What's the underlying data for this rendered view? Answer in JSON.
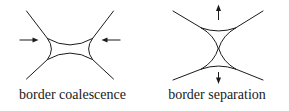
{
  "figure": {
    "background_color": "#ffffff",
    "ink_color": "#1b1b1b",
    "panels": [
      {
        "id": "coalescence",
        "caption": "border coalescence",
        "diagram_name": "concave-square-border-diagram",
        "arrows": [
          {
            "name": "arrow-left-inward",
            "direction": "right",
            "label": ""
          },
          {
            "name": "arrow-right-inward",
            "direction": "left",
            "label": ""
          }
        ]
      },
      {
        "id": "separation",
        "caption": "border separation",
        "diagram_name": "hourglass-border-diagram",
        "arrows": [
          {
            "name": "arrow-top-outward",
            "direction": "up",
            "label": ""
          },
          {
            "name": "arrow-bottom-outward",
            "direction": "down",
            "label": ""
          }
        ]
      }
    ]
  }
}
